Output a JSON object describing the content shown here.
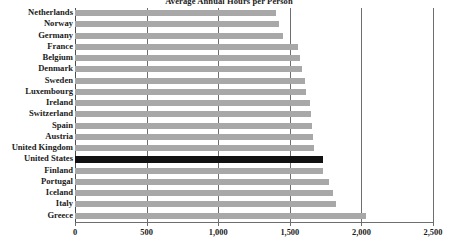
{
  "chart_data": {
    "type": "bar",
    "orientation": "horizontal",
    "title": "Average Annual Hours per Person",
    "xlabel": "",
    "ylabel": "",
    "xlim": [
      0,
      2500
    ],
    "xticks": [
      0,
      500,
      1000,
      1500,
      2000,
      2500
    ],
    "xtick_labels": [
      "0",
      "500",
      "1,000",
      "1,500",
      "2,000",
      "2,500"
    ],
    "grid": true,
    "grid_axis": "x",
    "legend": false,
    "highlight_category": "United States",
    "colors": {
      "bar": "#a8a8a8",
      "highlight_bar": "#111111",
      "gridline": "#6e6e6e",
      "text": "#1a1a1a",
      "background": "#ffffff"
    },
    "categories": [
      "Netherlands",
      "Norway",
      "Germany",
      "France",
      "Belgium",
      "Denmark",
      "Sweden",
      "Luxembourg",
      "Ireland",
      "Switzerland",
      "Spain",
      "Austria",
      "United Kingdom",
      "United States",
      "Finland",
      "Portugal",
      "Iceland",
      "Italy",
      "Greece"
    ],
    "values": [
      1403,
      1424,
      1452,
      1554,
      1568,
      1586,
      1603,
      1610,
      1641,
      1650,
      1655,
      1661,
      1670,
      1732,
      1732,
      1774,
      1802,
      1823,
      2032
    ]
  }
}
